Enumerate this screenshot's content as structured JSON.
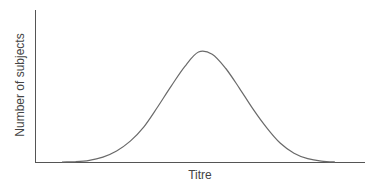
{
  "chart_data": {
    "type": "line",
    "title": "",
    "xlabel": "Titre",
    "ylabel": "Number of subjects",
    "grid": false,
    "legend": null,
    "x_ticks": [],
    "y_ticks": [],
    "x": [
      0,
      5,
      10,
      15,
      20,
      25,
      30,
      35,
      40,
      45,
      50,
      55,
      60,
      65,
      70,
      75,
      80,
      85,
      90,
      95,
      100
    ],
    "values": [
      0,
      0.3,
      1.5,
      4.5,
      10,
      19,
      32,
      50,
      69,
      87,
      100,
      98,
      85,
      67,
      48,
      31,
      17,
      8,
      3,
      0.8,
      0
    ],
    "xlim": [
      0,
      100
    ],
    "ylim": [
      0,
      100
    ],
    "colors": {
      "curve": "#6a6a6a",
      "axes": "#555555",
      "text": "#444444"
    }
  }
}
